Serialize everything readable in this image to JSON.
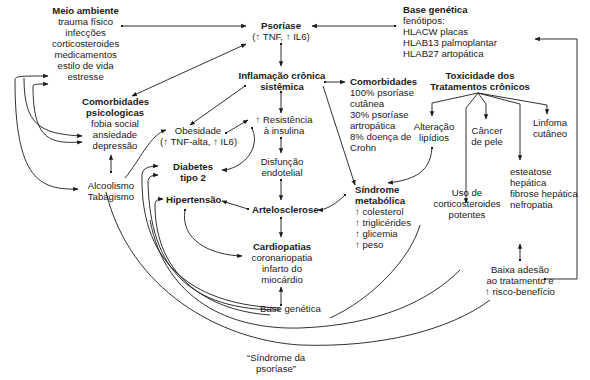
{
  "nodes": {
    "meio_ambiente": {
      "title": "Meio ambiente",
      "lines": [
        "trauma físico",
        "infecções",
        "corticosteroides",
        "medicamentos",
        "estilo de vida",
        "estresse"
      ]
    },
    "psoriase": {
      "title": "Psoríase",
      "lines": [
        "(↑ TNF, ↑ IL6)"
      ]
    },
    "base_genetica_top": {
      "title": "Base genética",
      "lines": [
        "fenótipos:",
        "HLACW placas",
        "HLAB13 palmoplantar",
        "HLAB27 artopática"
      ]
    },
    "inflamacao": {
      "title_lines": [
        "Inflamação crônica",
        "sistêmica"
      ]
    },
    "comorbidades": {
      "title": "Comorbidades",
      "lines": [
        "100% psoríase",
        "cutânea",
        "30% psoríase",
        "artropática",
        "8% doença de",
        "Crohn"
      ]
    },
    "toxicidade": {
      "title_lines": [
        "Toxicidade dos",
        "Tratamentos crônicos"
      ]
    },
    "comorb_psico": {
      "title_lines": [
        "Comorbidades",
        "psicologicas"
      ],
      "lines": [
        "fobia social",
        "ansiedade",
        "depressão"
      ]
    },
    "obesidade": {
      "lines": [
        "Obesidade",
        "(↑ TNF-alta, ↑ IL6)"
      ]
    },
    "resistencia": {
      "lines": [
        "↑ Resistência",
        "à insulina"
      ]
    },
    "alteracao": {
      "lines": [
        "Alteração",
        "lipídios"
      ]
    },
    "cancer": {
      "lines": [
        "Câncer",
        "de pele"
      ]
    },
    "linfoma": {
      "lines": [
        "Linfoma",
        "cutâneo"
      ]
    },
    "disfuncao": {
      "lines": [
        "Disfunção",
        "endotelial"
      ]
    },
    "diabetes": {
      "title_lines": [
        "Diabetes",
        "tipo 2"
      ]
    },
    "alcoolismo": {
      "lines": [
        "Alcoolismo",
        "Tabagismo"
      ]
    },
    "hipertensao": {
      "title": "Hipertensão"
    },
    "arteriosclerose": {
      "title": "Artelosclerose"
    },
    "sindrome_metabolica": {
      "title_lines": [
        "Síndrome",
        "metabólica"
      ],
      "lines": [
        "↑ colesterol",
        "↑ triglicérides",
        "↑ glicemia",
        "↑ peso"
      ]
    },
    "corticosteroides": {
      "lines": [
        "Uso de",
        "corticosteroides",
        "potentes"
      ]
    },
    "esteatose": {
      "lines": [
        "esteatose",
        "hepática",
        "fibrose hepática",
        "nefropatia"
      ]
    },
    "cardiopatias": {
      "title": "Cardiopatias",
      "lines": [
        "coronariopatia",
        "infarto do",
        "miocárdio"
      ]
    },
    "baixa_adesao": {
      "lines": [
        "Baixa adesão",
        "ao tratamento e",
        "↑ risco-benefício"
      ]
    },
    "base_genetica_bottom": {
      "lines": [
        "Base genética"
      ]
    },
    "sindrome_psoriase": {
      "lines": [
        "“Síndrome da",
        "psoríase”"
      ]
    }
  },
  "colors": {
    "line": "#1a1a1a",
    "text": "#1a1a1a",
    "background": "#ffffff"
  }
}
